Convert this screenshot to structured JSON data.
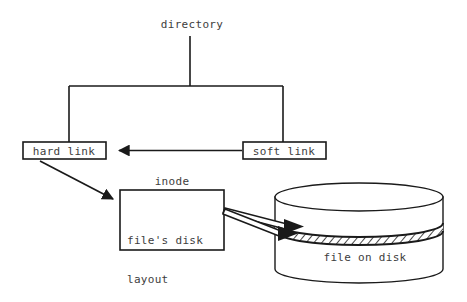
{
  "diagram": {
    "title": "directory",
    "background_color": "#ffffff",
    "stroke_color": "#1a1a1a",
    "text_color": "#3d3d3d",
    "nodes": {
      "directory": {
        "label": "directory"
      },
      "hard_link": {
        "label": "hard link"
      },
      "soft_link": {
        "label": "soft link"
      },
      "inode": {
        "label": "inode"
      },
      "inode_contents": {
        "line1": "file's disk",
        "line2": "layout"
      },
      "disk": {
        "label": "file on disk"
      }
    },
    "edges": [
      {
        "from": "directory",
        "to": "hard link",
        "style": "plain-line"
      },
      {
        "from": "directory",
        "to": "soft link",
        "style": "plain-line"
      },
      {
        "from": "soft link",
        "to": "hard link",
        "style": "solid-arrow"
      },
      {
        "from": "hard link",
        "to": "inode",
        "style": "solid-arrow"
      },
      {
        "from": "inode",
        "to": "file on disk",
        "style": "open-arrow"
      },
      {
        "from": "inode",
        "to": "file on disk",
        "style": "open-arrow"
      }
    ],
    "disk_band": {
      "fill": "hatched",
      "meaning": "file data extent"
    }
  }
}
